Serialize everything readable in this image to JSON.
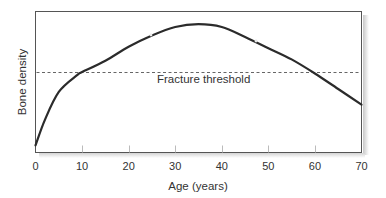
{
  "chart_data": {
    "type": "line",
    "title": "",
    "xlabel": "Age (years)",
    "ylabel": "Bone density",
    "xlim": [
      0,
      70
    ],
    "ylim": [
      0,
      100
    ],
    "xticks": [
      0,
      10,
      20,
      30,
      40,
      50,
      60,
      70
    ],
    "yticks": [],
    "grid": false,
    "legend": null,
    "series": [
      {
        "name": "Bone density",
        "x": [
          0,
          2,
          5,
          9,
          10,
          15,
          20,
          25,
          30,
          35,
          40,
          45,
          50,
          55,
          60,
          65,
          70
        ],
        "y": [
          5,
          23,
          43,
          55,
          57,
          65,
          75,
          83,
          89,
          91,
          89,
          82,
          74,
          66,
          56,
          45,
          34
        ],
        "color": "#2b2b2b",
        "style": "solid"
      }
    ],
    "reference_lines": [
      {
        "orientation": "horizontal",
        "y": 57,
        "label": "Fracture threshold",
        "color": "#666666",
        "style": "dashed"
      }
    ],
    "annotations": [
      {
        "text": "Fracture threshold",
        "x": 35,
        "y": 57,
        "position": "below-line"
      }
    ]
  },
  "labels": {
    "xlabel": "Age (years)",
    "ylabel": "Bone density",
    "threshold": "Fracture threshold",
    "xticks": [
      "0",
      "10",
      "20",
      "30",
      "40",
      "50",
      "60",
      "70"
    ]
  },
  "colors": {
    "curve": "#2b2b2b",
    "threshold": "#666666",
    "frame": "#555555",
    "shadow": "#cfcfcf",
    "text": "#333333"
  }
}
